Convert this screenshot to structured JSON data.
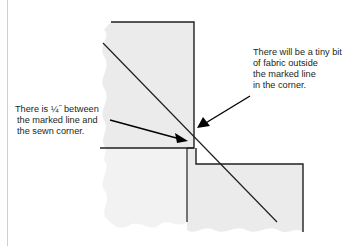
{
  "diagram": {
    "callouts": {
      "left": {
        "lines": [
          "There is ¼˝ between",
          "the marked line and",
          "the sewn corner."
        ]
      },
      "right": {
        "lines": [
          "There will be a tiny bit",
          "of fabric outside",
          "the marked line",
          "in the corner."
        ]
      }
    },
    "colors": {
      "fabric": "#ebebeb",
      "fabric_light": "#f2f2f2",
      "seam_line": "#231f20",
      "margin_rule": "#cfcfcf"
    }
  }
}
